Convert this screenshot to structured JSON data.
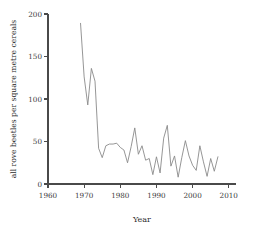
{
  "chart_data": {
    "type": "line",
    "title": "",
    "xlabel": "Year",
    "ylabel": "all rove beetles per square metre cereals",
    "xlim": [
      1960,
      2012
    ],
    "ylim": [
      0,
      200
    ],
    "grid": false,
    "legend": "none",
    "xticks": [
      1960,
      1970,
      1980,
      1990,
      2000,
      2010
    ],
    "xticklabels": [
      "1960",
      "1970",
      "1980",
      "1990",
      "2000",
      "2010"
    ],
    "yticks": [
      0,
      50,
      100,
      150,
      200
    ],
    "yticklabels": [
      "0",
      "50",
      "100",
      "150",
      "200"
    ],
    "line_color": "#8a8a8a",
    "axis_color": "#4a4a4a",
    "series": [
      {
        "name": "all rove beetles per square metre cereals",
        "x": [
          1969,
          1970,
          1971,
          1972,
          1973,
          1974,
          1975,
          1976,
          1977,
          1978,
          1979,
          1980,
          1981,
          1982,
          1983,
          1984,
          1985,
          1986,
          1987,
          1988,
          1989,
          1990,
          1991,
          1992,
          1993,
          1994,
          1995,
          1996,
          1997,
          1998,
          1999,
          2000,
          2001,
          2002,
          2003,
          2004,
          2005,
          2006,
          2007
        ],
        "values": [
          189,
          126,
          93,
          136,
          121,
          42,
          31,
          45,
          47,
          47,
          48,
          43,
          40,
          25,
          44,
          66,
          35,
          45,
          28,
          30,
          11,
          32,
          13,
          54,
          69,
          21,
          33,
          8,
          31,
          51,
          33,
          22,
          16,
          45,
          26,
          9,
          30,
          15,
          32
        ]
      }
    ]
  }
}
